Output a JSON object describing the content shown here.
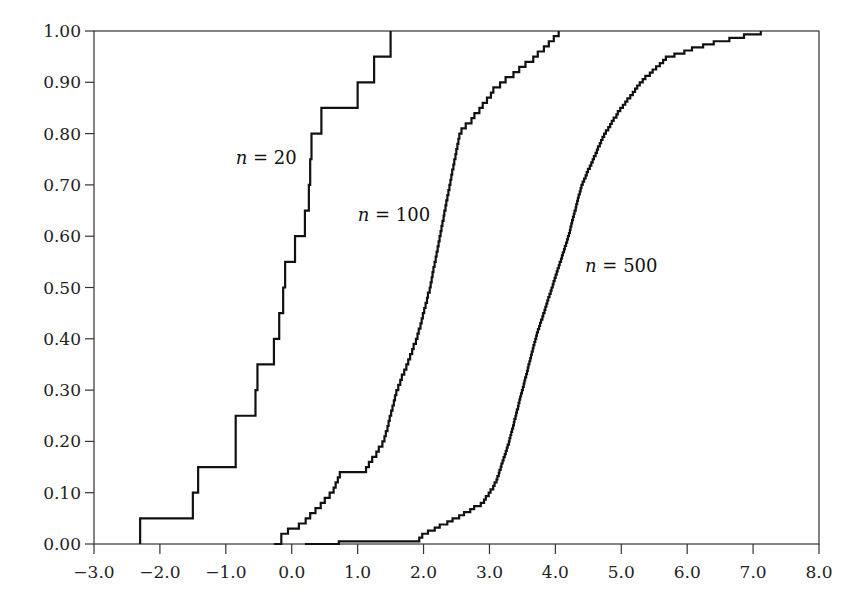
{
  "chart_data": {
    "type": "line",
    "subtype": "empirical-cdf-step",
    "title": "",
    "xlabel": "",
    "ylabel": "",
    "xlim": [
      -3.0,
      8.0
    ],
    "ylim": [
      0.0,
      1.0
    ],
    "grid": false,
    "legend": "inline labels",
    "x_ticks": [
      "−3.0",
      "−2.0",
      "−1.0",
      "0.0",
      "1.0",
      "2.0",
      "3.0",
      "4.0",
      "5.0",
      "6.0",
      "7.0",
      "8.0"
    ],
    "x_tick_values": [
      -3,
      -2,
      -1,
      0,
      1,
      2,
      3,
      4,
      5,
      6,
      7,
      8
    ],
    "y_ticks": [
      "0.00",
      "0.10",
      "0.20",
      "0.30",
      "0.40",
      "0.50",
      "0.60",
      "0.70",
      "0.80",
      "0.90",
      "1.00"
    ],
    "y_tick_values": [
      0,
      0.1,
      0.2,
      0.3,
      0.4,
      0.5,
      0.6,
      0.7,
      0.8,
      0.9,
      1.0
    ],
    "series": [
      {
        "name": "n = 20",
        "label_n": "n",
        "label_eq": " = 20",
        "label_pos": [
          -0.85,
          0.74
        ],
        "steps": [
          [
            -2.3,
            0.05
          ],
          [
            -1.5,
            0.1
          ],
          [
            -1.42,
            0.15
          ],
          [
            -0.85,
            0.25
          ],
          [
            -0.55,
            0.3
          ],
          [
            -0.52,
            0.35
          ],
          [
            -0.27,
            0.4
          ],
          [
            -0.19,
            0.45
          ],
          [
            -0.13,
            0.5
          ],
          [
            -0.1,
            0.55
          ],
          [
            0.05,
            0.6
          ],
          [
            0.2,
            0.65
          ],
          [
            0.26,
            0.7
          ],
          [
            0.28,
            0.75
          ],
          [
            0.3,
            0.8
          ],
          [
            0.45,
            0.85
          ],
          [
            1.0,
            0.9
          ],
          [
            1.25,
            0.95
          ],
          [
            1.5,
            1.0
          ]
        ]
      },
      {
        "name": "n = 100",
        "label_n": "n",
        "label_eq": " = 100",
        "label_pos": [
          1.0,
          0.63
        ],
        "anchors": [
          [
            -0.27,
            0.01
          ],
          [
            0.05,
            0.03
          ],
          [
            0.25,
            0.05
          ],
          [
            0.62,
            0.1
          ],
          [
            0.75,
            0.14
          ],
          [
            1.1,
            0.14
          ],
          [
            1.4,
            0.2
          ],
          [
            1.6,
            0.3
          ],
          [
            1.9,
            0.4
          ],
          [
            2.1,
            0.5
          ],
          [
            2.25,
            0.6
          ],
          [
            2.4,
            0.7
          ],
          [
            2.55,
            0.8
          ],
          [
            2.75,
            0.83
          ],
          [
            3.1,
            0.89
          ],
          [
            3.5,
            0.93
          ],
          [
            3.8,
            0.96
          ],
          [
            4.1,
            1.0
          ]
        ]
      },
      {
        "name": "n = 500",
        "label_n": "n",
        "label_eq": " = 500",
        "label_pos": [
          4.45,
          0.53
        ],
        "anchors": [
          [
            0.2,
            0.0
          ],
          [
            1.5,
            0.005
          ],
          [
            1.9,
            0.005
          ],
          [
            2.0,
            0.02
          ],
          [
            2.5,
            0.05
          ],
          [
            2.9,
            0.08
          ],
          [
            3.1,
            0.12
          ],
          [
            3.3,
            0.2
          ],
          [
            3.5,
            0.3
          ],
          [
            3.7,
            0.4
          ],
          [
            3.95,
            0.5
          ],
          [
            4.2,
            0.6
          ],
          [
            4.4,
            0.7
          ],
          [
            4.75,
            0.8
          ],
          [
            5.0,
            0.85
          ],
          [
            5.3,
            0.9
          ],
          [
            5.7,
            0.95
          ],
          [
            6.5,
            0.98
          ],
          [
            7.3,
            1.0
          ]
        ]
      }
    ]
  }
}
